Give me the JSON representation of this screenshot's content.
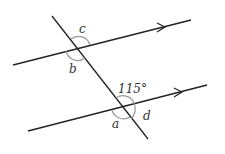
{
  "diagram": {
    "type": "parallel lines cut by a transversal",
    "angle_labels": {
      "c": "c",
      "b": "b",
      "given": "115°",
      "a": "a",
      "d": "d"
    },
    "colors": {
      "line": "#222222",
      "arc": "#999999",
      "text": "#333333"
    }
  }
}
